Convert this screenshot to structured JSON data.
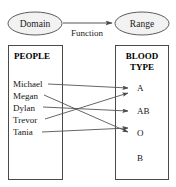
{
  "diagram": {
    "type": "function-mapping-diagram",
    "domain_node": {
      "label": "Domain"
    },
    "range_node": {
      "label": "Range"
    },
    "relation_label": "Function",
    "domain_box": {
      "title_line1": "PEOPLE",
      "title_line2": "",
      "items": [
        {
          "label": "Michael"
        },
        {
          "label": "Megan"
        },
        {
          "label": "Dylan"
        },
        {
          "label": "Trevor"
        },
        {
          "label": "Tania"
        }
      ]
    },
    "range_box": {
      "title_line1": "BLOOD",
      "title_line2": "TYPE",
      "items": [
        {
          "label": "A"
        },
        {
          "label": "AB"
        },
        {
          "label": "O"
        },
        {
          "label": "B"
        }
      ]
    },
    "mappings": [
      {
        "from": "Michael",
        "to": "A"
      },
      {
        "from": "Megan",
        "to": "O"
      },
      {
        "from": "Dylan",
        "to": "AB"
      },
      {
        "from": "Trevor",
        "to": "A"
      },
      {
        "from": "Tania",
        "to": "O"
      }
    ],
    "colors": {
      "line": "#555555",
      "box_border": "#4a4a4a",
      "ellipse_fill": "#f2f2f2",
      "text": "#151515",
      "background": "#ffffff"
    }
  }
}
